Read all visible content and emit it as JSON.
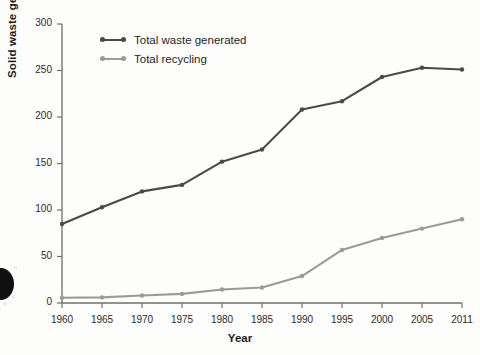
{
  "chart_data": {
    "type": "line",
    "title": "",
    "xlabel": "Year",
    "ylabel": "Solid waste generated (million tons)",
    "categories": [
      "1960",
      "1965",
      "1970",
      "1975",
      "1980",
      "1985",
      "1990",
      "1995",
      "2000",
      "2005",
      "2011"
    ],
    "x": [
      1960,
      1965,
      1970,
      1975,
      1980,
      1985,
      1990,
      1995,
      2000,
      2005,
      2011
    ],
    "xlim": [
      1960,
      2011
    ],
    "ylim": [
      0,
      300
    ],
    "yticks": [
      0,
      50,
      100,
      150,
      200,
      250,
      300
    ],
    "ytick_labels": [
      "0",
      "50",
      "100",
      "150",
      "200",
      "250",
      "300"
    ],
    "grid": false,
    "legend_position": "upper-left-inside",
    "series": [
      {
        "name": "Total waste generated",
        "color": "#4a4a4a",
        "values": [
          85,
          103,
          120,
          127,
          152,
          165,
          208,
          217,
          243,
          253,
          251
        ]
      },
      {
        "name": "Total recycling",
        "color": "#9a9a9a",
        "values": [
          5.6,
          6,
          8,
          9.8,
          14.5,
          16.7,
          29,
          57,
          70,
          80,
          90
        ]
      }
    ]
  },
  "axes": {
    "y_title": "Solid waste generated (million tons)",
    "x_title": "Year"
  },
  "legend": {
    "items": [
      {
        "label": "Total waste generated"
      },
      {
        "label": "Total recycling"
      }
    ]
  },
  "colors": {
    "waste": "#4a4a4a",
    "recycling": "#9a9a9a",
    "axis": "#6e6e6e",
    "text": "#1c1c1c",
    "background": "#fdfdfc"
  }
}
